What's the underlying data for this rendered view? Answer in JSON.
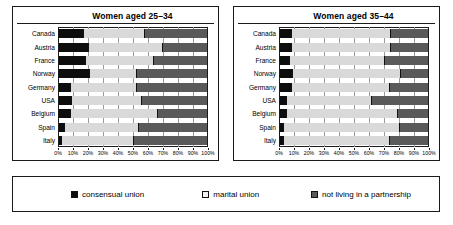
{
  "chart_data": [
    {
      "type": "bar",
      "orientation": "horizontal",
      "stacked": true,
      "title": "Women aged 25–34",
      "xlabel": "",
      "ylabel": "",
      "xlim": [
        0,
        100
      ],
      "xticks": [
        "0%",
        "10%",
        "20%",
        "30%",
        "40%",
        "50%",
        "60%",
        "70%",
        "80%",
        "90%",
        "100%"
      ],
      "grid": true,
      "categories": [
        "Canada",
        "Austria",
        "France",
        "Norway",
        "Germany",
        "USA",
        "Belgium",
        "Spain",
        "Italy"
      ],
      "series": [
        {
          "name": "consensual union",
          "values": [
            17,
            20,
            18,
            21,
            8,
            9,
            8,
            4,
            2
          ]
        },
        {
          "name": "marital union",
          "values": [
            41,
            50,
            46,
            32,
            45,
            47,
            59,
            50,
            49
          ]
        },
        {
          "name": "not living in a partnership",
          "values": [
            42,
            30,
            36,
            47,
            47,
            44,
            33,
            46,
            49
          ]
        }
      ]
    },
    {
      "type": "bar",
      "orientation": "horizontal",
      "stacked": true,
      "title": "Women aged 35–44",
      "xlabel": "",
      "ylabel": "",
      "xlim": [
        0,
        100
      ],
      "xticks": [
        "0%",
        "10%",
        "20%",
        "30%",
        "40%",
        "50%",
        "60%",
        "70%",
        "80%",
        "90%",
        "100%"
      ],
      "grid": true,
      "categories": [
        "Canada",
        "Austria",
        "France",
        "Norway",
        "Germany",
        "USA",
        "Belgium",
        "Spain",
        "Italy"
      ],
      "series": [
        {
          "name": "consensual union",
          "values": [
            8,
            8,
            7,
            9,
            8,
            5,
            5,
            3,
            3
          ]
        },
        {
          "name": "marital union",
          "values": [
            67,
            67,
            64,
            73,
            66,
            57,
            75,
            78,
            71
          ]
        },
        {
          "name": "not living in a partnership",
          "values": [
            25,
            25,
            29,
            18,
            26,
            38,
            20,
            19,
            26
          ]
        }
      ]
    }
  ],
  "legend": {
    "position": "bottom",
    "items": [
      {
        "label": "consensual union",
        "color": "#0d0d0d"
      },
      {
        "label": "marital union",
        "color": "#f2f2f2"
      },
      {
        "label": "not living in a partnership",
        "color": "#5a5a5a"
      }
    ]
  },
  "colors": {
    "consensual_union": "#0d0d0d",
    "marital_union": "#d9d9d9",
    "not_living_in_a_partnership": "#5a5a5a",
    "frame": "#1a1a1a",
    "grid": "#9a9a9a",
    "background": "#ffffff"
  }
}
